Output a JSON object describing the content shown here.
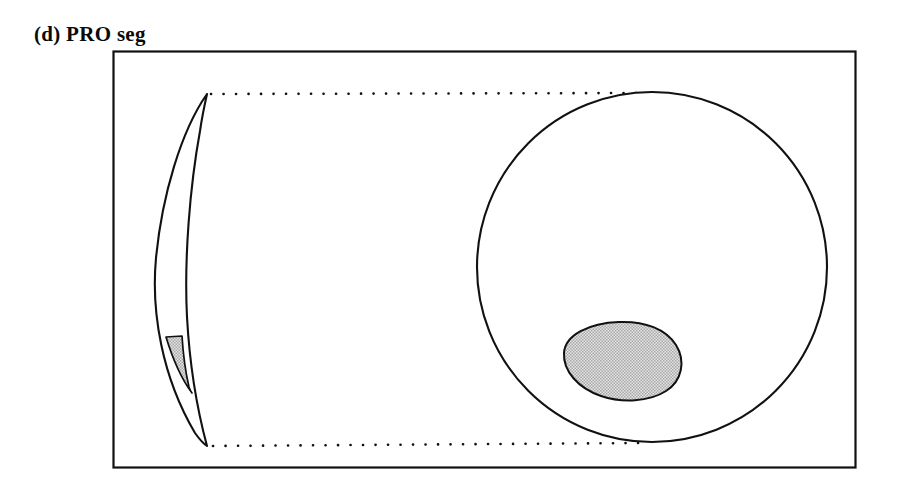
{
  "figure": {
    "caption": "(d) PRO seg",
    "caption_label": "(d)",
    "caption_text": "PRO seg",
    "background_color": "#ffffff",
    "stroke_color": "#111111",
    "shaded_fill_color": "#c9c9c9",
    "shaded_pattern": "halftone-dot",
    "frame": {
      "name": "figure-border",
      "x": 113,
      "y": 51,
      "width": 743,
      "height": 417,
      "stroke_width": 2.2,
      "fill": "none"
    },
    "elements": [
      {
        "name": "crescent-blade",
        "type": "crescent",
        "description": "curved sickle shaped cross-section on the left",
        "tip_top": [
          207,
          94
        ],
        "tip_bottom": [
          207,
          446
        ],
        "max_bulge_x": 156,
        "inner_edge_x": 188
      },
      {
        "name": "crescent-shaded-wedge",
        "type": "polygon",
        "description": "narrow gray shaded wedge near the lower end of the crescent",
        "fill": "#c9c9c9",
        "top_y": 336,
        "bottom_y": 392
      },
      {
        "name": "circle-section",
        "type": "circle",
        "description": "large circular cross-section on the right",
        "center": [
          652,
          267
        ],
        "radius": 175,
        "stroke_width": 2.0,
        "fill": "none"
      },
      {
        "name": "circle-shaded-blob",
        "type": "blob",
        "description": "gray shaded egg/oval region inside the lower-left of the circle",
        "center": [
          620,
          360
        ],
        "rx": 58,
        "ry": 38,
        "fill": "#c9c9c9"
      },
      {
        "name": "dotted-tangent-line-top",
        "type": "dotted-line",
        "from": [
          210,
          94
        ],
        "to": [
          640,
          94
        ],
        "dot_spacing": 12
      },
      {
        "name": "dotted-tangent-line-bottom",
        "type": "dotted-line",
        "from": [
          212,
          446
        ],
        "to": [
          640,
          446
        ],
        "dot_spacing": 12
      }
    ]
  }
}
